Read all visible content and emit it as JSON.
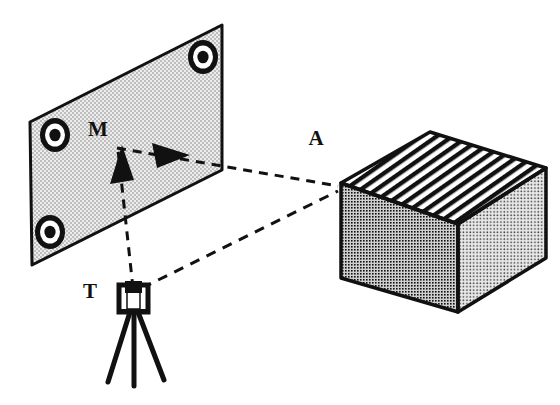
{
  "figure": {
    "type": "technical-line-diagram",
    "background_color": "#ffffff",
    "ink_color": "#111111",
    "width": 560,
    "height": 405
  },
  "labels": {
    "plane": "M",
    "object": "A",
    "instrument": "T"
  },
  "label_positions": {
    "plane": {
      "x": 98,
      "y": 136
    },
    "object": {
      "x": 316,
      "y": 145
    },
    "instrument": {
      "x": 86,
      "y": 298
    }
  },
  "plane": {
    "name": "reference-target-plane",
    "label": "M",
    "fill_color": "#ececec",
    "stipple_color": "#6e6e6e",
    "outline_color": "#111111",
    "corners": [
      {
        "x": 30,
        "y": 122
      },
      {
        "x": 222,
        "y": 25
      },
      {
        "x": 222,
        "y": 170
      },
      {
        "x": 32,
        "y": 265
      }
    ],
    "targets": [
      {
        "name": "bullseye-target-top-right",
        "cx": 203,
        "cy": 57,
        "rx": 15,
        "ry": 17
      },
      {
        "name": "bullseye-target-mid-left",
        "cx": 55,
        "cy": 135,
        "rx": 15,
        "ry": 17
      },
      {
        "name": "bullseye-target-bottom-left",
        "cx": 50,
        "cy": 232,
        "rx": 15,
        "ry": 17
      }
    ],
    "target_rings": {
      "outer_color": "#111111",
      "middle_color": "#ffffff",
      "center_color": "#111111",
      "middle_scale": 0.66,
      "center_scale": 0.36
    }
  },
  "cube": {
    "name": "target-object-cube",
    "label": "A",
    "outline_color": "#111111",
    "top_face": {
      "name": "cube-top-face",
      "pattern": "diagonal-hatch",
      "hatch_color": "#111111",
      "fill_color": "#ffffff",
      "points": "341,183 430,132 546,168 458,224"
    },
    "left_face": {
      "name": "cube-left-face",
      "pattern": "dense-dots",
      "fill_color": "#d3d3d3",
      "dot_color": "#111111",
      "points": "341,183 458,224 458,312 341,278"
    },
    "right_face": {
      "name": "cube-right-face",
      "pattern": "light-dots",
      "fill_color": "#e6e6e6",
      "dot_color": "#4a4a4a",
      "points": "458,224 546,168 546,258 458,312"
    }
  },
  "theodolite": {
    "name": "theodolite-on-tripod",
    "label": "T",
    "color": "#111111",
    "station_point": {
      "x": 133,
      "y": 295
    },
    "head": {
      "x": 120,
      "y": 286,
      "width": 27,
      "height": 26
    },
    "legs": [
      {
        "x1": 131,
        "y1": 312,
        "x2": 108,
        "y2": 382
      },
      {
        "x1": 137,
        "y1": 312,
        "x2": 163,
        "y2": 380
      },
      {
        "x1": 134,
        "y1": 312,
        "x2": 134,
        "y2": 385
      }
    ]
  },
  "sight_lines": {
    "name": "dashed-sight-lines",
    "color": "#111111",
    "dash_pattern": "9,7",
    "stroke_width": 3,
    "lines": [
      {
        "name": "sight-line-instrument-to-plane",
        "from": "T",
        "to": "M",
        "x1": 133,
        "y1": 288,
        "x2": 119,
        "y2": 150,
        "arrow": "up"
      },
      {
        "name": "sight-line-plane-to-object",
        "from": "M",
        "to": "A",
        "x1": 117,
        "y1": 148,
        "x2": 338,
        "y2": 186,
        "arrow": "right"
      },
      {
        "name": "sight-line-instrument-to-object",
        "from": "T",
        "to": "A",
        "x1": 141,
        "y1": 288,
        "x2": 338,
        "y2": 190,
        "arrow": "none"
      }
    ],
    "arrowheads": [
      {
        "name": "arrowhead-toward-object",
        "direction": "right",
        "tip_x": 190,
        "tip_y": 155,
        "length": 38,
        "half_width": 13
      },
      {
        "name": "arrowhead-toward-plane",
        "direction": "up",
        "tip_x": 122,
        "tip_y": 145,
        "length": 38,
        "half_width": 12
      }
    ]
  }
}
